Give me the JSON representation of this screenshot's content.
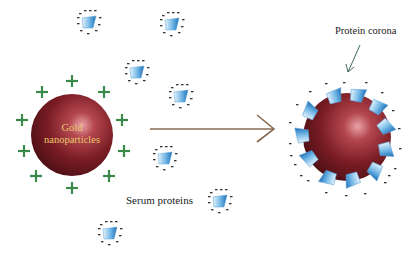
{
  "diagram": {
    "labels": {
      "nanoparticle": [
        "Gold",
        "nanoparticles"
      ],
      "serum": "Serum proteins",
      "corona": "Protein corona"
    },
    "nanoparticle_charge": "+",
    "protein_charge": "-",
    "colors": {
      "sphere": "#6e1a1f",
      "sphere_highlight": "#e89aa0",
      "plus": "#3a8a4a",
      "protein": "#3a8fd0",
      "arrow": "#8a6a50",
      "label_gold": "#e8c86a"
    },
    "free_proteins": [
      {
        "x": 88,
        "y": 22
      },
      {
        "x": 172,
        "y": 22
      },
      {
        "x": 136,
        "y": 72
      },
      {
        "x": 180,
        "y": 95
      },
      {
        "x": 165,
        "y": 157
      },
      {
        "x": 220,
        "y": 200
      },
      {
        "x": 110,
        "y": 232
      }
    ]
  }
}
